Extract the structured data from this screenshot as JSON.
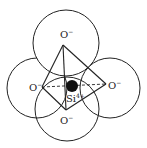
{
  "diagram": {
    "oxygen_label": "O",
    "oxygen_charge": "−",
    "silicon_label": "Si",
    "silicon_charge": "4+",
    "colors": {
      "stroke": "#222222",
      "background": "#ffffff",
      "silicon_fill": "#111111"
    },
    "atoms": [
      {
        "id": "oxygen-top",
        "label": "O",
        "charge": "−"
      },
      {
        "id": "oxygen-left",
        "label": "O",
        "charge": "−"
      },
      {
        "id": "oxygen-right",
        "label": "O",
        "charge": "−"
      },
      {
        "id": "oxygen-bottom",
        "label": "O",
        "charge": "−"
      },
      {
        "id": "silicon-center",
        "label": "Si",
        "charge": "4+"
      }
    ]
  }
}
